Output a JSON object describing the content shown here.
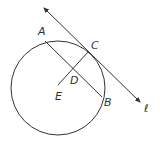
{
  "diagram": {
    "type": "geometry-figure",
    "stroke_color": "#333333",
    "background": "#ffffff",
    "circle": {
      "cx": 58,
      "cy": 88,
      "r": 47
    },
    "points": {
      "A": {
        "label": "A",
        "x": 45,
        "y": 41,
        "lx": 38,
        "ly": 35
      },
      "B": {
        "label": "B",
        "x": 102,
        "y": 97,
        "lx": 105,
        "ly": 106
      },
      "C": {
        "label": "C",
        "x": 88,
        "y": 52,
        "lx": 92,
        "ly": 49
      },
      "D": {
        "label": "D",
        "x": 74,
        "y": 70,
        "lx": 71,
        "ly": 84
      },
      "E": {
        "label": "E",
        "x": 58,
        "y": 85,
        "lx": 55,
        "ly": 100
      }
    },
    "line_l": {
      "label": "ℓ",
      "x1": 44,
      "y1": 8,
      "x2": 140,
      "y2": 102,
      "lx": 145,
      "ly": 111
    },
    "segments": [
      {
        "name": "chord-AB",
        "from": "A",
        "to": "B"
      },
      {
        "name": "segment-EC",
        "from": "E",
        "to": "C"
      }
    ]
  }
}
